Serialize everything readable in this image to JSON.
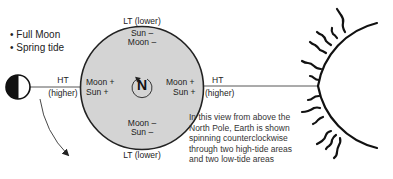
{
  "legend": {
    "items": [
      "Full Moon",
      "Spring tide"
    ],
    "bullet": "•"
  },
  "moon": {
    "phase": "full",
    "tide_label": "HT",
    "tide_sub": "(higher)"
  },
  "earth": {
    "top": {
      "label": "LT (lower)",
      "line1": "Sun –",
      "line2": "Moon –"
    },
    "bottom": {
      "label": "LT (lower)",
      "line1": "Moon –",
      "line2": "Sun –"
    },
    "left": {
      "line1": "Moon +",
      "line2": "Sun +"
    },
    "right": {
      "line1": "Moon +",
      "line2": "Sun +"
    },
    "pole_label": "N",
    "fill_color": "#d4d4d4"
  },
  "sun_side": {
    "tide_label": "HT",
    "tide_sub": "(higher)"
  },
  "note": {
    "lines": [
      "In this view from above the",
      "North Pole, Earth is shown",
      "spinning counterclockwise",
      "through two high-tide areas",
      "and two low-tide areas"
    ]
  }
}
